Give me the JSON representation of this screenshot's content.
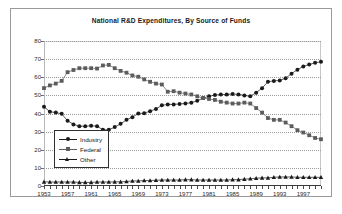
{
  "chart_data": {
    "type": "line",
    "title": "National R&D Expenditures, By Source of Funds",
    "xlabel": "",
    "ylabel": "",
    "ylim": [
      0,
      80
    ],
    "xlim": [
      1953,
      2000
    ],
    "grid": true,
    "legend_position": "inside-bottom-left",
    "ytick_labels": [
      "0",
      "10",
      "20",
      "30",
      "40",
      "50",
      "60",
      "70",
      "80"
    ],
    "ytick_values": [
      0,
      10,
      20,
      30,
      40,
      50,
      60,
      70,
      80
    ],
    "xtick_labels": [
      "1953",
      "1957",
      "1961",
      "1965",
      "1969",
      "1973",
      "1977",
      "1981",
      "1985",
      "1989",
      "1993",
      "1997"
    ],
    "xtick_values": [
      1953,
      1957,
      1961,
      1965,
      1969,
      1973,
      1977,
      1981,
      1985,
      1989,
      1993,
      1997
    ],
    "x": [
      1953,
      1954,
      1955,
      1956,
      1957,
      1958,
      1959,
      1960,
      1961,
      1962,
      1963,
      1964,
      1965,
      1966,
      1967,
      1968,
      1969,
      1970,
      1971,
      1972,
      1973,
      1974,
      1975,
      1976,
      1977,
      1978,
      1979,
      1980,
      1981,
      1982,
      1983,
      1984,
      1985,
      1986,
      1987,
      1988,
      1989,
      1990,
      1991,
      1992,
      1993,
      1994,
      1995,
      1996,
      1997,
      1998,
      1999,
      2000
    ],
    "series": [
      {
        "name": "Industry",
        "marker": "circle",
        "color": "#1a1a1a",
        "values": [
          43.7,
          41.0,
          40.5,
          39.8,
          36.0,
          34.0,
          33.0,
          33.0,
          33.2,
          33.0,
          31.0,
          31.0,
          32.5,
          34.3,
          36.5,
          38.0,
          40.0,
          40.2,
          41.3,
          42.5,
          44.5,
          45.0,
          45.0,
          45.3,
          45.5,
          46.0,
          47.0,
          48.5,
          49.5,
          50.2,
          50.5,
          50.5,
          50.8,
          50.5,
          50.0,
          49.5,
          51.5,
          54.0,
          57.5,
          58.0,
          58.2,
          59.5,
          62.0,
          64.2,
          66.0,
          67.0,
          68.0,
          68.5
        ]
      },
      {
        "name": "Federal",
        "marker": "square",
        "color": "#5c5c5c",
        "values": [
          54.0,
          55.5,
          56.5,
          58.0,
          62.8,
          64.0,
          65.0,
          65.0,
          65.0,
          64.8,
          66.5,
          66.8,
          65.0,
          63.5,
          62.5,
          61.0,
          60.3,
          58.8,
          57.5,
          56.5,
          56.0,
          52.0,
          52.3,
          51.5,
          51.0,
          50.5,
          49.5,
          48.5,
          48.0,
          47.5,
          46.5,
          46.0,
          45.5,
          45.5,
          46.0,
          45.5,
          43.0,
          40.5,
          37.5,
          36.5,
          36.5,
          35.0,
          33.0,
          30.8,
          29.5,
          28.0,
          26.5,
          25.8
        ]
      },
      {
        "name": "Other",
        "marker": "triangle",
        "color": "#1a1a1a",
        "values": [
          2.3,
          2.2,
          2.2,
          2.2,
          2.2,
          2.2,
          2.0,
          2.0,
          2.0,
          2.2,
          2.2,
          2.2,
          2.3,
          2.3,
          2.5,
          2.8,
          2.8,
          3.0,
          3.0,
          3.2,
          3.3,
          3.3,
          3.3,
          3.3,
          3.5,
          3.5,
          3.3,
          3.3,
          3.3,
          3.3,
          3.3,
          3.3,
          3.5,
          3.5,
          3.8,
          4.0,
          4.3,
          4.5,
          4.5,
          4.8,
          5.0,
          5.0,
          5.0,
          4.8,
          4.8,
          4.8,
          4.8,
          4.8
        ]
      }
    ]
  }
}
